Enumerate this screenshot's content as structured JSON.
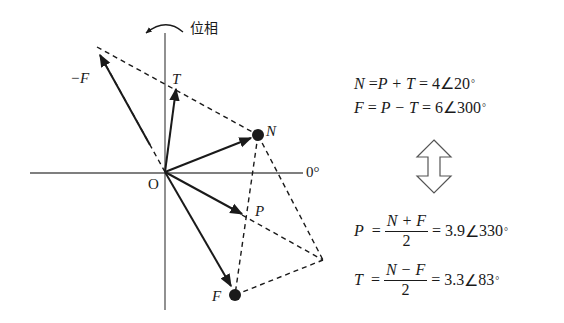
{
  "diagram": {
    "type": "phasor-diagram",
    "rotation_label": "位相",
    "origin_label": "O",
    "zero_degree_label": "0°",
    "vectors": [
      {
        "name": "N",
        "label": "N",
        "magnitude": 4,
        "angle_deg": 20,
        "marker": "dot"
      },
      {
        "name": "F",
        "label": "F",
        "magnitude": 6,
        "angle_deg": 300,
        "marker": "dot"
      },
      {
        "name": "P",
        "label": "P",
        "magnitude": 3.9,
        "angle_deg": 330,
        "marker": "arrow"
      },
      {
        "name": "T",
        "label": "T",
        "magnitude": 3.3,
        "angle_deg": 83,
        "marker": "arrow"
      },
      {
        "name": "-F",
        "label": "−F",
        "magnitude": 6,
        "angle_deg": 120,
        "marker": "arrow"
      }
    ]
  },
  "equations": {
    "top": [
      {
        "lhs": "N",
        "rhs_expr": "P + T",
        "result_mag": "4",
        "result_angle": "20"
      },
      {
        "lhs": "F",
        "rhs_expr": "P − T",
        "result_mag": "6",
        "result_angle": "300"
      }
    ],
    "bottom": [
      {
        "lhs": "P",
        "numerator": "N + F",
        "denominator": "2",
        "result_mag": "3.9",
        "result_angle": "330"
      },
      {
        "lhs": "T",
        "numerator": "N − F",
        "denominator": "2",
        "result_mag": "3.3",
        "result_angle": "83"
      }
    ],
    "eq_sign": "=",
    "angle_symbol": "∠",
    "degree_symbol": "°",
    "arrow_icon": "double-vertical-arrow"
  }
}
